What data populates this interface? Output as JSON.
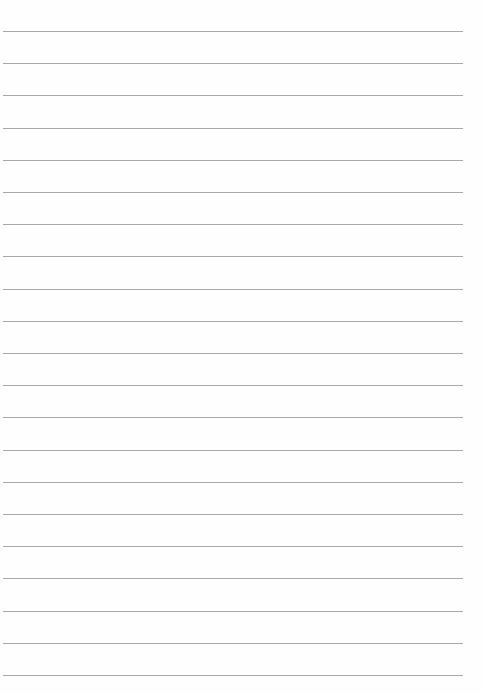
{
  "page": {
    "type": "lined-paper",
    "line_count": 21,
    "first_line_y": 31,
    "line_spacing": 32.2,
    "line_left": 3,
    "line_width": 460,
    "line_color": "#9a9a9a",
    "background_color": "#fefefe"
  }
}
